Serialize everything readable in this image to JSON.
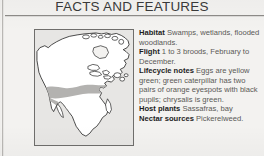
{
  "header": {
    "title": "FACTS AND FEATURES"
  },
  "map": {
    "name": "north-america-range-map",
    "region": "North America",
    "land_color": "#ffffff",
    "outline_color": "#111111",
    "range_color": "#b3b2b0",
    "panel_bg": "#e7e6e4",
    "range_description": "Shaded band across the southern and southeastern United States into northeastern Mexico"
  },
  "facts": [
    {
      "label": "Habitat",
      "value": "Swamps, wetlands, flooded woodlands."
    },
    {
      "label": "Flight",
      "value": "1 to 3 broods, February to December."
    },
    {
      "label": "Lifecycle notes",
      "value": "Eggs are yellow green; green caterpillar has two pairs of orange eyespots with black pupils; chrysalis is green."
    },
    {
      "label": "Host plants",
      "value": "Sassafras, bay"
    },
    {
      "label": "Nectar sources",
      "value": "Pickerelweed."
    }
  ]
}
